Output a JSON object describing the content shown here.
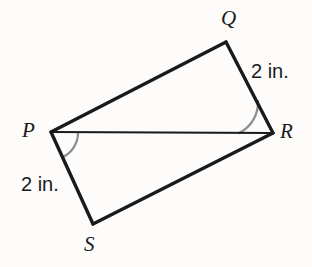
{
  "figure": {
    "background_color": "#fdfcfa",
    "stroke_color": "#1a1a1a",
    "arc_color": "#8c8c8c",
    "vertices": [
      {
        "name": "P",
        "label": "P",
        "x": 51,
        "y": 132
      },
      {
        "name": "Q",
        "label": "Q",
        "x": 226,
        "y": 42
      },
      {
        "name": "R",
        "label": "R",
        "x": 273,
        "y": 133
      },
      {
        "name": "S",
        "label": "S",
        "x": 93,
        "y": 224
      }
    ],
    "edges": [
      {
        "name": "edge-PQ",
        "from": "P",
        "to": "Q",
        "width": 3.4
      },
      {
        "name": "edge-QR",
        "from": "Q",
        "to": "R",
        "width": 3.4
      },
      {
        "name": "edge-RS",
        "from": "R",
        "to": "S",
        "width": 3.4
      },
      {
        "name": "edge-SP",
        "from": "S",
        "to": "P",
        "width": 3.4
      },
      {
        "name": "diagonal-PR",
        "from": "P",
        "to": "R",
        "width": 1.8
      }
    ],
    "measures": [
      {
        "name": "measure-QR",
        "text": "2 in.",
        "edge": "QR"
      },
      {
        "name": "measure-PS",
        "text": "2 in.",
        "edge": "SP"
      }
    ],
    "angle_marks": [
      {
        "name": "angle-SPR",
        "vertex": "P",
        "between": [
          "PR",
          "PS"
        ]
      },
      {
        "name": "angle-QRP",
        "vertex": "R",
        "between": [
          "RQ",
          "RP"
        ]
      }
    ]
  }
}
